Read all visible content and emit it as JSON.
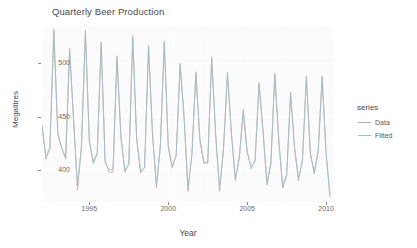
{
  "chart_data": {
    "type": "line",
    "title": "Quarterly Beer Production",
    "xlabel": "Year",
    "ylabel": "Megalitres",
    "xlim": [
      1992.0,
      2010.5
    ],
    "ylim": [
      370,
      535
    ],
    "grid": true,
    "legend_position": "right",
    "legend_title": "series",
    "x_ticks": [
      "1995",
      "2000",
      "2005",
      "2010"
    ],
    "x_tick_values": [
      1995,
      2000,
      2005,
      2010
    ],
    "y_ticks": [
      "400",
      "450",
      "500"
    ],
    "y_tick_values": [
      400,
      450,
      500
    ],
    "colors": {
      "data": "#c9a6a6",
      "fitted": "#9fbfc4",
      "panel": "#fbfbfb",
      "grid": "#ffffff",
      "text": "#4a4a4a"
    },
    "x": [
      1992.0,
      1992.25,
      1992.5,
      1992.75,
      1993.0,
      1993.25,
      1993.5,
      1993.75,
      1994.0,
      1994.25,
      1994.5,
      1994.75,
      1995.0,
      1995.25,
      1995.5,
      1995.75,
      1996.0,
      1996.25,
      1996.5,
      1996.75,
      1997.0,
      1997.25,
      1997.5,
      1997.75,
      1998.0,
      1998.25,
      1998.5,
      1998.75,
      1999.0,
      1999.25,
      1999.5,
      1999.75,
      2000.0,
      2000.25,
      2000.5,
      2000.75,
      2001.0,
      2001.25,
      2001.5,
      2001.75,
      2002.0,
      2002.25,
      2002.5,
      2002.75,
      2003.0,
      2003.25,
      2003.5,
      2003.75,
      2004.0,
      2004.25,
      2004.5,
      2004.75,
      2005.0,
      2005.25,
      2005.5,
      2005.75,
      2006.0,
      2006.25,
      2006.5,
      2006.75,
      2007.0,
      2007.25,
      2007.5,
      2007.75,
      2008.0,
      2008.25,
      2008.5,
      2008.75,
      2009.0,
      2009.25,
      2009.5,
      2009.75,
      2010.0,
      2010.25
    ],
    "series": [
      {
        "name": "Data",
        "color": "#c9a6a6",
        "values": [
          443,
          410,
          420,
          532,
          433,
          421,
          410,
          512,
          449,
          381,
          423,
          531,
          426,
          408,
          416,
          520,
          409,
          398,
          398,
          507,
          432,
          398,
          406,
          526,
          428,
          397,
          403,
          517,
          435,
          383,
          424,
          521,
          421,
          402,
          414,
          500,
          451,
          380,
          416,
          492,
          428,
          408,
          406,
          506,
          435,
          380,
          421,
          490,
          435,
          390,
          412,
          454,
          416,
          403,
          408,
          482,
          438,
          386,
          405,
          491,
          427,
          383,
          394,
          473,
          420,
          390,
          410,
          488,
          415,
          398,
          419,
          488,
          414,
          374
        ]
      },
      {
        "name": "Fitted",
        "color": "#9fbfc4",
        "values": [
          440,
          413,
          421,
          529,
          436,
          420,
          412,
          514,
          446,
          385,
          421,
          528,
          428,
          406,
          415,
          518,
          407,
          400,
          401,
          504,
          430,
          400,
          405,
          523,
          429,
          399,
          402,
          515,
          433,
          386,
          422,
          519,
          423,
          404,
          413,
          498,
          448,
          383,
          415,
          490,
          430,
          406,
          408,
          504,
          433,
          383,
          419,
          492,
          433,
          392,
          411,
          457,
          418,
          401,
          410,
          480,
          436,
          388,
          407,
          489,
          429,
          385,
          396,
          471,
          422,
          392,
          408,
          486,
          417,
          396,
          417,
          486,
          416,
          377
        ]
      }
    ]
  }
}
